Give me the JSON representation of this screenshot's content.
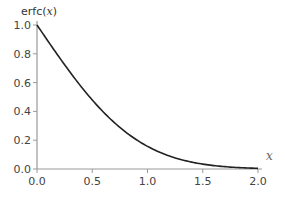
{
  "chart_data": {
    "type": "line",
    "title": "",
    "xlabel": "x",
    "ylabel": "erfc(x)",
    "xlim": [
      0.0,
      2.0
    ],
    "ylim": [
      0.0,
      1.0
    ],
    "grid": false,
    "legend": null,
    "x_ticks": [
      "0.0",
      "0.5",
      "1.0",
      "1.5",
      "2.0"
    ],
    "y_ticks": [
      "0.0",
      "0.2",
      "0.4",
      "0.6",
      "0.8",
      "1.0"
    ],
    "series": [
      {
        "name": "erfc(x)",
        "color": "#222222",
        "x": [
          0.0,
          0.1,
          0.2,
          0.3,
          0.4,
          0.5,
          0.6,
          0.7,
          0.8,
          0.9,
          1.0,
          1.1,
          1.2,
          1.3,
          1.4,
          1.5,
          1.6,
          1.7,
          1.8,
          1.9,
          2.0
        ],
        "y": [
          1.0,
          0.8875,
          0.7773,
          0.6714,
          0.5716,
          0.4795,
          0.3961,
          0.3222,
          0.2579,
          0.2031,
          0.1573,
          0.1198,
          0.0897,
          0.066,
          0.0477,
          0.0339,
          0.0237,
          0.0162,
          0.0109,
          0.0072,
          0.0047
        ]
      }
    ]
  },
  "labels": {
    "ylabel_prefix": "erfc(",
    "ylabel_var": "x",
    "ylabel_suffix": ")",
    "xlabel": "x"
  },
  "colors": {
    "axis": "#999999",
    "curve": "#222222",
    "text": "#444444"
  }
}
